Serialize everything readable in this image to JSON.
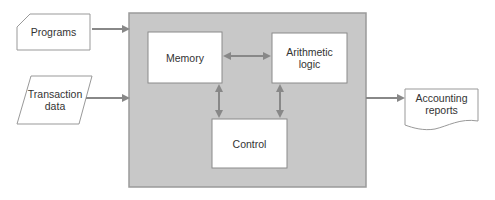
{
  "diagram": {
    "colors": {
      "container_fill": "#c8c8c8",
      "container_border": "#9a9a9a",
      "box_fill": "#ffffff",
      "box_border": "#8a8a8a",
      "arrow": "#888888",
      "text": "#333333"
    },
    "inputs": [
      {
        "id": "programs",
        "shape": "card",
        "label": "Programs"
      },
      {
        "id": "transaction-data",
        "shape": "parallelogram",
        "label": "Transaction\ndata"
      }
    ],
    "processor": {
      "components": [
        {
          "id": "memory",
          "label": "Memory"
        },
        {
          "id": "arithmetic-logic",
          "label": "Arithmetic\nlogic"
        },
        {
          "id": "control",
          "label": "Control"
        }
      ],
      "connections": [
        {
          "from": "memory",
          "to": "arithmetic-logic",
          "bidirectional": true
        },
        {
          "from": "memory",
          "to": "control",
          "bidirectional": true
        },
        {
          "from": "arithmetic-logic",
          "to": "control",
          "bidirectional": true
        }
      ]
    },
    "outputs": [
      {
        "id": "accounting-reports",
        "shape": "document",
        "label": "Accounting\nreports"
      }
    ],
    "flows": [
      {
        "from": "programs",
        "to": "processor"
      },
      {
        "from": "transaction-data",
        "to": "processor"
      },
      {
        "from": "processor",
        "to": "accounting-reports"
      }
    ]
  }
}
